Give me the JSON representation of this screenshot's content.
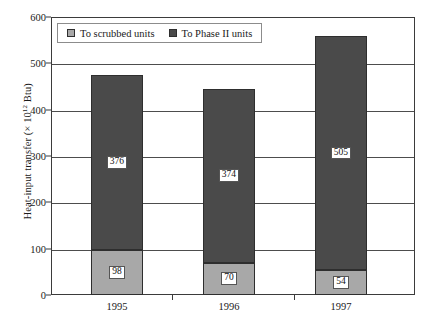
{
  "chart_data": {
    "type": "bar",
    "subtype": "stacked-bar",
    "title": "",
    "xlabel": "",
    "ylabel": "Heat-input transfer (× 10¹² Btu)",
    "ylabel_parts": {
      "text_before": "Heat-input transfer (× 10",
      "superscript": "12",
      "text_after": " Btu)"
    },
    "categories": [
      "1995",
      "1996",
      "1997"
    ],
    "series": [
      {
        "name": "To scrubbed units",
        "color": "#a8a8a8",
        "values": [
          98,
          70,
          54
        ]
      },
      {
        "name": "To Phase II units",
        "color": "#4a4a4a",
        "values": [
          376,
          374,
          505
        ]
      }
    ],
    "totals": [
      474,
      444,
      559
    ],
    "ylim": [
      0,
      600
    ],
    "yticks": [
      0,
      100,
      200,
      300,
      400,
      500,
      600
    ],
    "ytick_labels": [
      "0",
      "100",
      "200",
      "300",
      "400",
      "500",
      "600"
    ],
    "grid": true,
    "grid_axis": "y",
    "legend_position": "top-left-inside",
    "data_labels": true
  },
  "legend": {
    "items": [
      {
        "label": "To scrubbed units",
        "color": "#a8a8a8"
      },
      {
        "label": "To Phase II units",
        "color": "#4a4a4a"
      }
    ]
  },
  "colors": {
    "scrubbed": "#a8a8a8",
    "phase2": "#4a4a4a",
    "axis": "#3b3b3b",
    "grid": "#4d4d4d",
    "text": "#1a1a1a",
    "background": "#ffffff"
  }
}
